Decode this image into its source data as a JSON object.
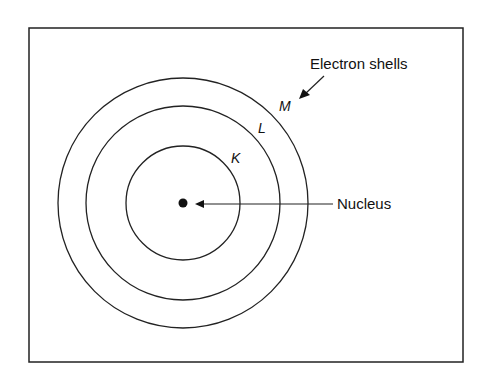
{
  "diagram": {
    "labels": {
      "electron_shells": "Electron shells",
      "nucleus": "Nucleus",
      "shell_m": "M",
      "shell_l": "L",
      "shell_k": "K"
    },
    "colors": {
      "stroke": "#222222",
      "background": "#ffffff"
    }
  }
}
